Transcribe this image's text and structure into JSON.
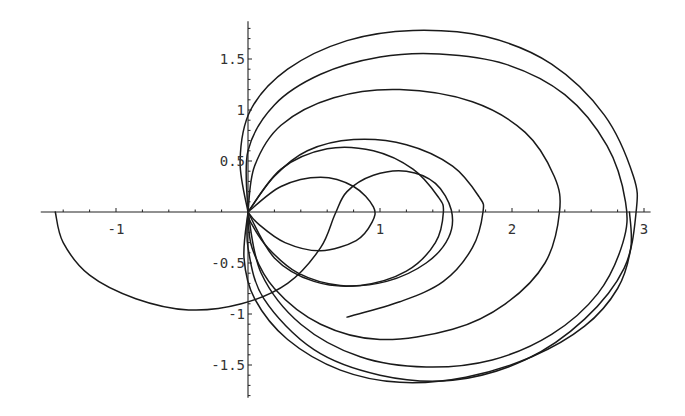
{
  "chart_data": {
    "type": "line",
    "title": "",
    "xlabel": "",
    "ylabel": "",
    "xlim": [
      -1.57,
      3.05
    ],
    "ylim": [
      -1.82,
      1.87
    ],
    "grid": false,
    "legend": null,
    "x_ticks": [
      {
        "value": -1,
        "label": "-1"
      },
      {
        "value": 1,
        "label": "1"
      },
      {
        "value": 2,
        "label": "2"
      },
      {
        "value": 3,
        "label": "3"
      }
    ],
    "y_ticks": [
      {
        "value": 1.5,
        "label": "1.5"
      },
      {
        "value": 1,
        "label": "1"
      },
      {
        "value": 0.5,
        "label": "0.5"
      },
      {
        "value": -0.5,
        "label": "-0.5"
      },
      {
        "value": -1,
        "label": "-1"
      },
      {
        "value": -1.5,
        "label": "-1.5"
      }
    ],
    "minor_ticks_per_major": 5,
    "series": [
      {
        "name": "curve-1",
        "points": [
          [
            0,
            0
          ],
          [
            -0.06,
            0.5
          ],
          [
            0.02,
            1.0
          ],
          [
            0.3,
            1.4
          ],
          [
            0.75,
            1.68
          ],
          [
            1.25,
            1.78
          ],
          [
            1.8,
            1.72
          ],
          [
            2.3,
            1.45
          ],
          [
            2.7,
            0.95
          ],
          [
            2.92,
            0.35
          ],
          [
            2.94,
            0
          ],
          [
            2.85,
            -0.55
          ],
          [
            2.55,
            -1.05
          ],
          [
            2.1,
            -1.45
          ],
          [
            1.55,
            -1.65
          ],
          [
            1.0,
            -1.6
          ],
          [
            0.5,
            -1.35
          ],
          [
            0.12,
            -0.85
          ],
          [
            0,
            -0.35
          ],
          [
            0,
            0
          ]
        ]
      },
      {
        "name": "curve-2",
        "points": [
          [
            0,
            0
          ],
          [
            0.0,
            0.6
          ],
          [
            0.2,
            1.05
          ],
          [
            0.55,
            1.35
          ],
          [
            1.0,
            1.52
          ],
          [
            1.45,
            1.55
          ],
          [
            1.95,
            1.45
          ],
          [
            2.4,
            1.15
          ],
          [
            2.72,
            0.65
          ],
          [
            2.86,
            0.1
          ],
          [
            2.84,
            -0.3
          ],
          [
            2.65,
            -0.8
          ],
          [
            2.3,
            -1.2
          ],
          [
            1.85,
            -1.45
          ],
          [
            1.35,
            -1.52
          ],
          [
            0.85,
            -1.42
          ],
          [
            0.4,
            -1.1
          ],
          [
            0.1,
            -0.6
          ],
          [
            0,
            0
          ]
        ]
      },
      {
        "name": "curve-3",
        "points": [
          [
            0,
            0
          ],
          [
            0.05,
            0.45
          ],
          [
            0.25,
            0.85
          ],
          [
            0.65,
            1.12
          ],
          [
            1.15,
            1.2
          ],
          [
            1.7,
            1.08
          ],
          [
            2.1,
            0.78
          ],
          [
            2.32,
            0.35
          ],
          [
            2.36,
            0
          ],
          [
            2.25,
            -0.5
          ],
          [
            1.95,
            -0.9
          ],
          [
            1.55,
            -1.15
          ],
          [
            1.0,
            -1.25
          ],
          [
            0.55,
            -1.1
          ],
          [
            0.2,
            -0.75
          ],
          [
            0.03,
            -0.35
          ],
          [
            0,
            0
          ]
        ]
      },
      {
        "name": "curve-4",
        "points": [
          [
            0,
            0
          ],
          [
            0.2,
            0.35
          ],
          [
            0.45,
            0.6
          ],
          [
            0.8,
            0.71
          ],
          [
            1.2,
            0.66
          ],
          [
            1.55,
            0.45
          ],
          [
            1.75,
            0.15
          ],
          [
            1.78,
            0
          ],
          [
            1.7,
            -0.35
          ],
          [
            1.48,
            -0.68
          ],
          [
            1.15,
            -0.88
          ],
          [
            0.75,
            -1.03
          ]
        ]
      },
      {
        "name": "curve-5",
        "points": [
          [
            0,
            0
          ],
          [
            0.25,
            0.42
          ],
          [
            0.6,
            0.62
          ],
          [
            0.95,
            0.6
          ],
          [
            1.25,
            0.42
          ],
          [
            1.44,
            0.15
          ],
          [
            1.48,
            0
          ],
          [
            1.42,
            -0.3
          ],
          [
            1.2,
            -0.58
          ],
          [
            0.85,
            -0.72
          ],
          [
            0.5,
            -0.68
          ],
          [
            0.2,
            -0.45
          ],
          [
            0,
            0
          ]
        ]
      },
      {
        "name": "curve-6",
        "points": [
          [
            0,
            0
          ],
          [
            0.25,
            0.25
          ],
          [
            0.55,
            0.34
          ],
          [
            0.8,
            0.25
          ],
          [
            0.95,
            0.05
          ],
          [
            0.94,
            -0.1
          ],
          [
            0.82,
            -0.28
          ],
          [
            0.55,
            -0.38
          ],
          [
            0.28,
            -0.3
          ],
          [
            0.08,
            -0.12
          ],
          [
            0,
            0
          ]
        ]
      },
      {
        "name": "curve-7",
        "points": [
          [
            -1.46,
            0
          ],
          [
            -1.4,
            -0.3
          ],
          [
            -1.2,
            -0.62
          ],
          [
            -0.85,
            -0.85
          ],
          [
            -0.45,
            -0.96
          ],
          [
            -0.05,
            -0.9
          ],
          [
            0.3,
            -0.7
          ],
          [
            0.55,
            -0.35
          ],
          [
            0.66,
            -0.02
          ],
          [
            0.75,
            0.2
          ],
          [
            0.95,
            0.36
          ],
          [
            1.2,
            0.4
          ],
          [
            1.42,
            0.28
          ],
          [
            1.54,
            0.02
          ],
          [
            1.52,
            -0.25
          ],
          [
            1.35,
            -0.5
          ],
          [
            1.05,
            -0.68
          ],
          [
            0.7,
            -0.72
          ],
          [
            0.38,
            -0.6
          ],
          [
            0.15,
            -0.35
          ],
          [
            0.02,
            -0.1
          ],
          [
            0,
            0
          ]
        ]
      },
      {
        "name": "curve-8",
        "points": [
          [
            0,
            0
          ],
          [
            -0.03,
            -0.45
          ],
          [
            0.05,
            -0.85
          ],
          [
            0.3,
            -1.25
          ],
          [
            0.7,
            -1.55
          ],
          [
            1.15,
            -1.67
          ],
          [
            1.65,
            -1.62
          ],
          [
            2.15,
            -1.42
          ],
          [
            2.55,
            -1.12
          ],
          [
            2.8,
            -0.75
          ],
          [
            2.9,
            -0.35
          ],
          [
            2.89,
            0
          ]
        ]
      }
    ]
  }
}
